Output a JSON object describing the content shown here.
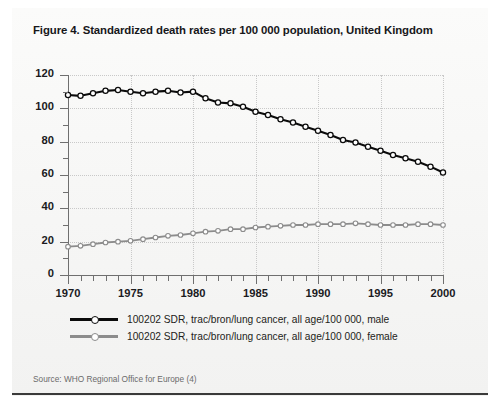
{
  "figure": {
    "title": "Figure 4.  Standardized death rates per 100 000 population, United Kingdom",
    "source": "Source:  WHO Regional Office for Europe (4)"
  },
  "legend": {
    "items": [
      {
        "label": "100202 SDR, trac/bron/lung cancer, all age/100 000, male",
        "color": "#0b0b0b",
        "marker": "circle-open"
      },
      {
        "label": "100202 SDR, trac/bron/lung cancer, all age/100 000, female",
        "color": "#8c8c8c",
        "marker": "circle-open"
      }
    ]
  },
  "axes": {
    "y_ticks": [
      "0",
      "20",
      "40",
      "60",
      "80",
      "100",
      "120"
    ],
    "x_ticks": [
      "1970",
      "1975",
      "1980",
      "1985",
      "1990",
      "1995",
      "2000"
    ]
  },
  "chart_data": {
    "type": "line",
    "title": "Figure 4.  Standardized death rates per 100 000 population, United Kingdom",
    "xlabel": "",
    "ylabel": "",
    "xlim": [
      1970,
      2000
    ],
    "ylim": [
      0,
      120
    ],
    "y_tick_step": 20,
    "y_minor_step": 10,
    "x_tick_step": 5,
    "x_minor_step": 1,
    "grid": true,
    "legend_position": "below-plot-left",
    "x": [
      1970,
      1971,
      1972,
      1973,
      1974,
      1975,
      1976,
      1977,
      1978,
      1979,
      1980,
      1981,
      1982,
      1983,
      1984,
      1985,
      1986,
      1987,
      1988,
      1989,
      1990,
      1991,
      1992,
      1993,
      1994,
      1995,
      1996,
      1997,
      1998,
      1999,
      2000
    ],
    "series": [
      {
        "name": "100202 SDR, trac/bron/lung cancer, all age/100 000, male",
        "color": "#0b0b0b",
        "values": [
          108.0,
          107.5,
          109.0,
          110.5,
          111.0,
          110.0,
          109.0,
          110.0,
          110.5,
          109.5,
          110.0,
          106.0,
          103.5,
          103.0,
          101.0,
          98.0,
          96.0,
          93.5,
          91.5,
          89.0,
          86.5,
          84.0,
          81.0,
          79.5,
          77.0,
          74.5,
          72.0,
          70.0,
          68.0,
          65.0,
          61.5
        ]
      },
      {
        "name": "100202 SDR, trac/bron/lung cancer, all age/100 000, female",
        "color": "#8c8c8c",
        "values": [
          17.0,
          17.5,
          18.5,
          19.5,
          20.0,
          20.5,
          21.5,
          22.5,
          23.5,
          24.0,
          25.0,
          26.0,
          26.5,
          27.5,
          27.5,
          28.5,
          29.0,
          29.5,
          30.0,
          30.0,
          30.5,
          30.5,
          30.5,
          31.0,
          30.5,
          30.0,
          30.0,
          30.0,
          30.5,
          30.5,
          30.0
        ]
      }
    ]
  }
}
